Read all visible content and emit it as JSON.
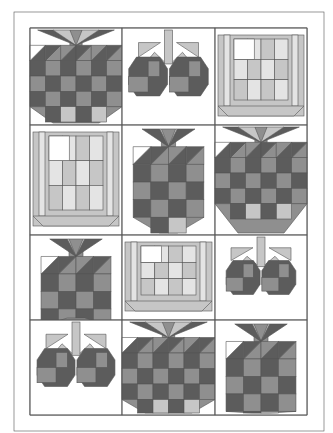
{
  "colors": {
    "dark": "#5c5c5c",
    "medium": "#8f8f8f",
    "light": "#c6c6c6",
    "pale": "#e4e4e4",
    "white": "#ffffff",
    "line": "#555555"
  },
  "layout": {
    "outer": {
      "x": 14,
      "y": 12,
      "w": 310,
      "h": 419
    },
    "inner": {
      "x": 30,
      "y": 28,
      "w": 277,
      "h": 387
    },
    "columns": [
      30,
      122,
      215,
      307
    ],
    "rows": [
      28,
      125,
      235,
      320,
      415
    ]
  },
  "blocks": [
    {
      "row": 0,
      "col": 0,
      "type": "strawberry-large"
    },
    {
      "row": 0,
      "col": 1,
      "type": "cherries"
    },
    {
      "row": 0,
      "col": 2,
      "type": "basket"
    },
    {
      "row": 1,
      "col": 0,
      "type": "basket"
    },
    {
      "row": 1,
      "col": 1,
      "type": "strawberry-small"
    },
    {
      "row": 1,
      "col": 2,
      "type": "strawberry-large"
    },
    {
      "row": 2,
      "col": 0,
      "type": "strawberry-small"
    },
    {
      "row": 2,
      "col": 1,
      "type": "basket"
    },
    {
      "row": 2,
      "col": 2,
      "type": "cherries"
    },
    {
      "row": 3,
      "col": 0,
      "type": "cherries"
    },
    {
      "row": 3,
      "col": 1,
      "type": "strawberry-large"
    },
    {
      "row": 3,
      "col": 2,
      "type": "strawberry-small"
    }
  ]
}
